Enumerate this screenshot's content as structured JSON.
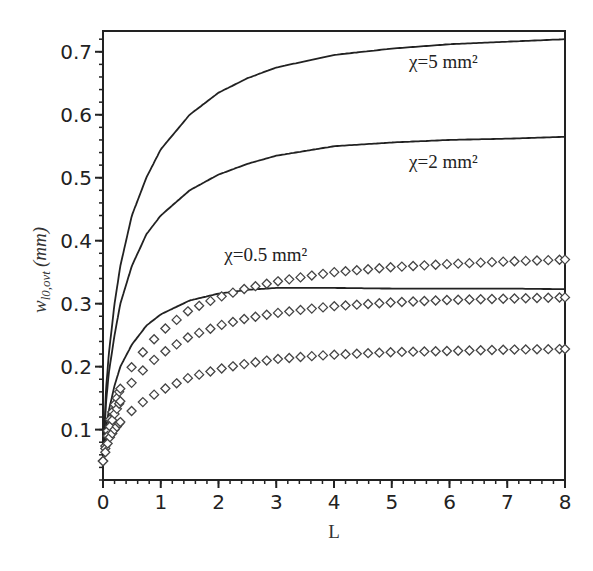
{
  "chart_data": {
    "type": "line",
    "title": "",
    "xlabel": "L",
    "ylabel": "w_{l0,ovt} (mm)",
    "ylabel_parts": {
      "main": "w",
      "sub": "l0,ovt",
      "unit": "(mm)"
    },
    "xlim": [
      0,
      8
    ],
    "ylim": [
      0.02,
      0.733
    ],
    "grid": false,
    "legend": "none (inline annotations)",
    "x_ticks": [
      0,
      1,
      2,
      3,
      4,
      5,
      6,
      7,
      8
    ],
    "y_ticks": [
      0.1,
      0.2,
      0.3,
      0.4,
      0.5,
      0.6,
      0.7
    ],
    "annotations": [
      {
        "text": "χ=5 mm²",
        "x": 5.3,
        "y": 0.675
      },
      {
        "text": "χ=2 mm²",
        "x": 5.3,
        "y": 0.515
      },
      {
        "text": "χ=0.5 mm²",
        "x": 2.1,
        "y": 0.368
      }
    ],
    "series": [
      {
        "name": "χ=5 mm² (solid)",
        "style": "solid",
        "x": [
          0,
          0.05,
          0.1,
          0.2,
          0.3,
          0.5,
          0.75,
          1,
          1.5,
          2,
          2.5,
          3,
          4,
          5,
          6,
          7,
          8
        ],
        "y": [
          0.04,
          0.16,
          0.22,
          0.3,
          0.36,
          0.44,
          0.5,
          0.545,
          0.6,
          0.635,
          0.658,
          0.675,
          0.695,
          0.705,
          0.712,
          0.716,
          0.72
        ]
      },
      {
        "name": "χ=2 mm² (solid)",
        "style": "solid",
        "x": [
          0,
          0.05,
          0.1,
          0.2,
          0.3,
          0.5,
          0.75,
          1,
          1.5,
          2,
          2.5,
          3,
          4,
          5,
          6,
          7,
          8
        ],
        "y": [
          0.04,
          0.14,
          0.19,
          0.25,
          0.3,
          0.36,
          0.41,
          0.44,
          0.48,
          0.505,
          0.522,
          0.535,
          0.55,
          0.556,
          0.56,
          0.562,
          0.565
        ]
      },
      {
        "name": "χ=0.5 mm² (solid)",
        "style": "solid",
        "x": [
          0,
          0.05,
          0.1,
          0.2,
          0.3,
          0.5,
          0.75,
          1,
          1.5,
          2,
          2.5,
          3,
          4,
          5,
          6,
          7,
          8
        ],
        "y": [
          0.04,
          0.1,
          0.13,
          0.17,
          0.2,
          0.235,
          0.265,
          0.283,
          0.305,
          0.316,
          0.322,
          0.325,
          0.325,
          0.324,
          0.324,
          0.324,
          0.323
        ]
      },
      {
        "name": "diamond series A (top)",
        "style": "diamond",
        "x": [
          0,
          0.1,
          0.2,
          0.3,
          0.5,
          0.75,
          1,
          1.5,
          2,
          2.5,
          3,
          3.5,
          4,
          5,
          6,
          7,
          8
        ],
        "y": [
          0.05,
          0.11,
          0.14,
          0.165,
          0.2,
          0.23,
          0.255,
          0.29,
          0.31,
          0.325,
          0.335,
          0.343,
          0.35,
          0.358,
          0.363,
          0.367,
          0.37
        ]
      },
      {
        "name": "diamond series B (middle)",
        "style": "diamond",
        "x": [
          0,
          0.1,
          0.2,
          0.3,
          0.5,
          0.75,
          1,
          1.5,
          2,
          2.5,
          3,
          3.5,
          4,
          5,
          6,
          7,
          8
        ],
        "y": [
          0.05,
          0.1,
          0.125,
          0.145,
          0.175,
          0.2,
          0.22,
          0.248,
          0.265,
          0.277,
          0.285,
          0.291,
          0.296,
          0.302,
          0.306,
          0.308,
          0.31
        ]
      },
      {
        "name": "diamond series C (bottom)",
        "style": "diamond",
        "x": [
          0,
          0.1,
          0.2,
          0.3,
          0.5,
          0.75,
          1,
          1.5,
          2,
          2.5,
          3,
          3.5,
          4,
          5,
          6,
          7,
          8
        ],
        "y": [
          0.05,
          0.085,
          0.1,
          0.112,
          0.13,
          0.148,
          0.162,
          0.183,
          0.196,
          0.205,
          0.212,
          0.216,
          0.219,
          0.223,
          0.225,
          0.227,
          0.228
        ]
      }
    ]
  },
  "colors": {
    "line": "#222222",
    "axis": "#222222",
    "marker_stroke": "#444444",
    "background": "#ffffff"
  }
}
